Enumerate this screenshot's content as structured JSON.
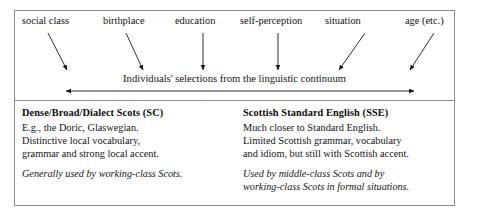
{
  "figure": {
    "name": "scots-linguistic-continuum-diagram",
    "border_color": "#8d8d8d",
    "text_color": "#141414",
    "arrow_color": "#1a1a1a"
  },
  "factors": [
    {
      "label": "social class",
      "x": 22,
      "arrow": {
        "x1": 48,
        "y1": 33,
        "x2": 67,
        "y2": 70
      }
    },
    {
      "label": "birthplace",
      "x": 103,
      "arrow": {
        "x1": 126,
        "y1": 33,
        "x2": 143,
        "y2": 70
      }
    },
    {
      "label": "education",
      "x": 175,
      "arrow": {
        "x1": 203,
        "y1": 33,
        "x2": 203,
        "y2": 70
      }
    },
    {
      "label": "self-perception",
      "x": 240,
      "arrow": {
        "x1": 278,
        "y1": 33,
        "x2": 278,
        "y2": 70
      }
    },
    {
      "label": "situation",
      "x": 325,
      "arrow": {
        "x1": 365,
        "y1": 33,
        "x2": 339,
        "y2": 70
      }
    },
    {
      "label": "age (etc.)",
      "x": 405,
      "arrow": {
        "x1": 434,
        "y1": 33,
        "x2": 410,
        "y2": 70
      }
    }
  ],
  "continuum": {
    "caption": "Individuals' selections from the linguistic continuum",
    "axis": {
      "x1": 66,
      "x2": 414,
      "y": 91,
      "double_headed": true
    }
  },
  "columns": [
    {
      "id": "dense-broad-dialect-scots",
      "heading": "Dense/Broad/Dialect Scots (SC)",
      "body": [
        "E.g., the Doric, Glaswegian.",
        "Distinctive local vocabulary,",
        "grammar and strong local accent."
      ],
      "note": [
        "Generally used by working-class Scots."
      ]
    },
    {
      "id": "scottish-standard-english",
      "heading": "Scottish Standard English (SSE)",
      "body": [
        "Much closer to Standard English.",
        "Limited Scottish grammar, vocabulary",
        "and idiom, but still with Scottish accent."
      ],
      "note": [
        "Used by middle-class Scots and by",
        "working-class Scots in formal situations."
      ]
    }
  ]
}
